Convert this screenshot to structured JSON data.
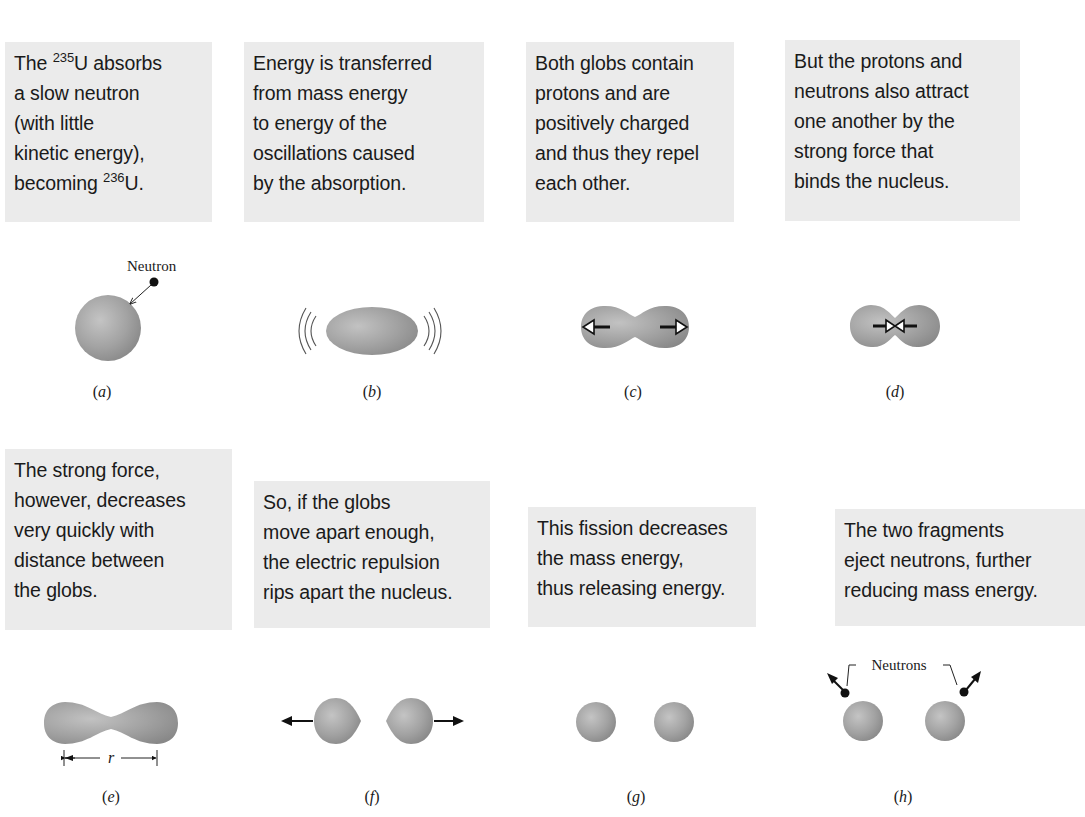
{
  "figure": {
    "colors": {
      "caption_bg": "#ebebeb",
      "nucleus_light": "#bdbdbd",
      "nucleus_dark": "#8a8a8a",
      "ink": "#111111"
    },
    "panels": [
      {
        "id": "a",
        "label": "a",
        "caption_lines": [
          "The |235|U absorbs",
          "a slow neutron",
          "(with little",
          "kinetic energy),",
          "becoming |236|U."
        ],
        "caption_parts": [
          [
            {
              "t": "The "
            },
            {
              "sup": "235"
            },
            {
              "t": "U absorbs"
            }
          ],
          [
            {
              "t": "a slow neutron"
            }
          ],
          [
            {
              "t": "(with little"
            }
          ],
          [
            {
              "t": "kinetic energy),"
            }
          ],
          [
            {
              "t": "becoming "
            },
            {
              "sup": "236"
            },
            {
              "t": "U."
            }
          ]
        ],
        "callout": "Neutron"
      },
      {
        "id": "b",
        "label": "b",
        "caption_parts": [
          [
            {
              "t": "Energy is transferred"
            }
          ],
          [
            {
              "t": "from mass energy"
            }
          ],
          [
            {
              "t": "to energy of the"
            }
          ],
          [
            {
              "t": "oscillations caused"
            }
          ],
          [
            {
              "t": "by the absorption."
            }
          ]
        ]
      },
      {
        "id": "c",
        "label": "c",
        "caption_parts": [
          [
            {
              "t": "Both globs contain"
            }
          ],
          [
            {
              "t": "protons and are"
            }
          ],
          [
            {
              "t": "positively charged"
            }
          ],
          [
            {
              "t": "and thus they repel"
            }
          ],
          [
            {
              "t": "each other."
            }
          ]
        ]
      },
      {
        "id": "d",
        "label": "d",
        "caption_parts": [
          [
            {
              "t": "But the protons and"
            }
          ],
          [
            {
              "t": "neutrons also attract"
            }
          ],
          [
            {
              "t": "one another by the"
            }
          ],
          [
            {
              "t": "strong force that"
            }
          ],
          [
            {
              "t": "binds the nucleus."
            }
          ]
        ]
      },
      {
        "id": "e",
        "label": "e",
        "caption_parts": [
          [
            {
              "t": "The strong force,"
            }
          ],
          [
            {
              "t": "however, decreases"
            }
          ],
          [
            {
              "t": "very quickly with"
            }
          ],
          [
            {
              "t": "distance between"
            }
          ],
          [
            {
              "t": "the globs."
            }
          ]
        ],
        "dimension_label": "r"
      },
      {
        "id": "f",
        "label": "f",
        "caption_parts": [
          [
            {
              "t": "So, if the globs"
            }
          ],
          [
            {
              "t": "move apart enough,"
            }
          ],
          [
            {
              "t": "the electric repulsion"
            }
          ],
          [
            {
              "t": "rips apart the nucleus."
            }
          ]
        ]
      },
      {
        "id": "g",
        "label": "g",
        "caption_parts": [
          [
            {
              "t": "This fission decreases"
            }
          ],
          [
            {
              "t": "the mass energy,"
            }
          ],
          [
            {
              "t": "thus releasing energy."
            }
          ]
        ]
      },
      {
        "id": "h",
        "label": "h",
        "caption_parts": [
          [
            {
              "t": "The two fragments"
            }
          ],
          [
            {
              "t": "eject neutrons, further"
            }
          ],
          [
            {
              "t": "reducing mass energy."
            }
          ]
        ],
        "callout": "Neutrons"
      }
    ]
  }
}
